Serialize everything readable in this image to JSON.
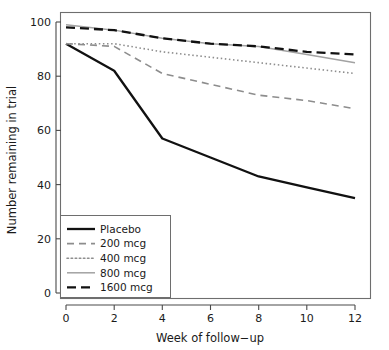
{
  "chart_data": {
    "type": "line",
    "title": "",
    "xlabel": "Week of follow−up",
    "ylabel": "Number remaining in trial",
    "x": [
      0,
      2,
      4,
      6,
      8,
      10,
      12
    ],
    "xlim": [
      -0.55,
      12.6
    ],
    "ylim": [
      -2,
      104
    ],
    "xticks": [
      0,
      2,
      4,
      6,
      8,
      10,
      12
    ],
    "xtick_labels": [
      "0",
      "2",
      "4",
      "6",
      "8",
      "10",
      "12"
    ],
    "yticks": [
      0,
      20,
      40,
      60,
      80,
      100
    ],
    "ytick_labels": [
      "0",
      "20",
      "40",
      "60",
      "80",
      "100"
    ],
    "grid": false,
    "legend_position": "lower-left",
    "series": [
      {
        "name": "Placebo",
        "values": [
          92,
          82,
          57,
          50,
          43,
          39,
          35
        ],
        "color": "#111111",
        "style": "solid",
        "width": 2.3,
        "dash": "none"
      },
      {
        "name": "200 mcg",
        "values": [
          92,
          91,
          81,
          77,
          73,
          71,
          68
        ],
        "color": "#8d8d8d",
        "style": "dashed",
        "width": 1.6,
        "dash": "7,5"
      },
      {
        "name": "400 mcg",
        "values": [
          92,
          92,
          89,
          87,
          85,
          83,
          81
        ],
        "color": "#8d8d8d",
        "style": "dotted",
        "width": 1.6,
        "dash": "1.5,2.6"
      },
      {
        "name": "800 mcg",
        "values": [
          99,
          97,
          94,
          92,
          91,
          88,
          85
        ],
        "color": "#a2a2a2",
        "style": "solid",
        "width": 1.5,
        "dash": "none"
      },
      {
        "name": "1600 mcg",
        "values": [
          98,
          97,
          94,
          92,
          91,
          89,
          88
        ],
        "color": "#111111",
        "style": "dashed",
        "width": 2.3,
        "dash": "9,5"
      }
    ]
  },
  "axes": {
    "x_title": "Week of follow−up",
    "y_title": "Number remaining in trial"
  },
  "legend": {
    "entries": [
      {
        "label": "Placebo"
      },
      {
        "label": "200 mcg"
      },
      {
        "label": "400 mcg"
      },
      {
        "label": "800 mcg"
      },
      {
        "label": "1600 mcg"
      }
    ]
  },
  "ticks": {
    "x": [
      "0",
      "2",
      "4",
      "6",
      "8",
      "10",
      "12"
    ],
    "y": [
      "0",
      "20",
      "40",
      "60",
      "80",
      "100"
    ]
  },
  "colors": {
    "placebo": "#111111",
    "mcg200": "#8d8d8d",
    "mcg400": "#8d8d8d",
    "mcg800": "#a2a2a2",
    "mcg1600": "#111111",
    "frame": "#6e6e6e",
    "text": "#1a1a1a",
    "background": "#ffffff"
  }
}
